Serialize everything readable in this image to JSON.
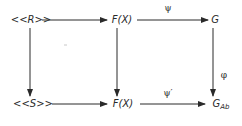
{
  "diagram": {
    "type": "commutative-diagram",
    "nodes": {
      "r": {
        "pre": "<<",
        "main": "R",
        "post": ">>"
      },
      "fx_top": {
        "main": "F(X)"
      },
      "g": {
        "main": "G"
      },
      "s": {
        "pre": "<<",
        "main": "S",
        "post": ">>"
      },
      "fx_bottom": {
        "main": "F(X)"
      },
      "gab": {
        "main": "G",
        "sub": "Ab"
      }
    },
    "arrows": {
      "r_to_fx": {
        "from": "<<R>>",
        "to": "F(X)",
        "label": ""
      },
      "fx_to_g": {
        "from": "F(X)",
        "to": "G",
        "label": "ψ"
      },
      "s_to_fx": {
        "from": "<<S>>",
        "to": "F(X)",
        "label": ""
      },
      "fx_to_gab": {
        "from": "F(X)",
        "to": "G_Ab",
        "label": "ψ′"
      },
      "r_to_s": {
        "from": "<<R>>",
        "to": "<<S>>",
        "label": ""
      },
      "fx_to_fx": {
        "from": "F(X)",
        "to": "F(X)",
        "label": ""
      },
      "g_to_gab": {
        "from": "G",
        "to": "G_Ab",
        "label": "φ"
      }
    },
    "colors": {
      "stroke": "#2a2a2a",
      "background": "#ffffff"
    }
  }
}
